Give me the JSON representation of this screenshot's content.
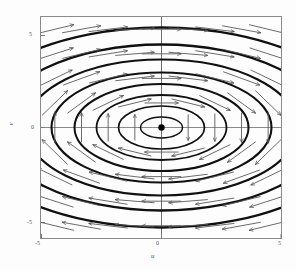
{
  "figure": {
    "kind": "phase-portrait",
    "background_color": "#fdfdfd",
    "frame_color": "#7a7a7a",
    "curve_color": "#111111",
    "arrow_color": "#555555",
    "fixed_point_color": "#000000"
  },
  "chart_data": {
    "type": "scatter",
    "title": "",
    "xlabel": "u",
    "ylabel": "v",
    "xlim": [
      -5.6,
      5.6
    ],
    "ylim": [
      -5.6,
      5.6
    ],
    "xticks": [
      -5,
      0,
      5
    ],
    "yticks": [
      -5,
      0,
      5
    ],
    "xtick_labels": [
      "-5",
      "0",
      "5"
    ],
    "ytick_labels": [
      "-5",
      "0",
      "5"
    ],
    "grid": false,
    "legend": null,
    "fixed_points": [
      {
        "x": 0,
        "y": 0,
        "type": "center",
        "marker": "filled-circle"
      }
    ],
    "trajectories": {
      "shape": "ellipse",
      "direction": "clockwise",
      "semi_axis_ratio_a_over_b": 1.95,
      "levels_a": [
        0.95,
        1.95,
        2.95,
        3.95,
        5.0,
        6.2,
        7.6
      ],
      "levels_b": [
        0.49,
        1.0,
        1.51,
        2.03,
        2.56,
        3.18,
        3.9
      ]
    },
    "vector_field": {
      "description": "clockwise rotational flow about the origin",
      "arrow_rows": 9,
      "arrow_cols": 9,
      "top_direction": "left",
      "bottom_direction": "right",
      "right_direction": "up",
      "left_direction": "down"
    }
  }
}
